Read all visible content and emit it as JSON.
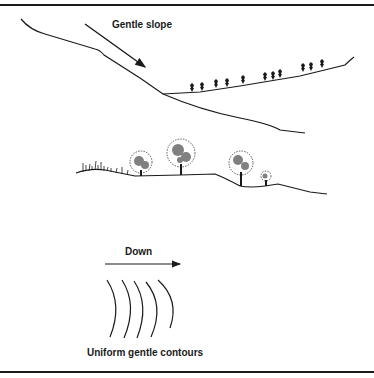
{
  "figure": {
    "upper_panel": {
      "label": "Gentle slope"
    },
    "lower_panel": {
      "arrow_label": "Down",
      "caption": "Uniform gentle contours"
    }
  },
  "colors": {
    "ink": "#1a1a1a",
    "background": "#ffffff"
  }
}
